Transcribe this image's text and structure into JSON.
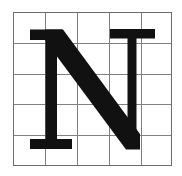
{
  "figure": {
    "kind": "letterform-grid-specimen",
    "title": "N",
    "background_color": "#ffffff"
  },
  "grid": {
    "name": "proportion-grid",
    "columns": 5,
    "rows": 5,
    "x_start": 13,
    "y_start": 12,
    "x_end": 171,
    "y_end": 165,
    "cell_width": 31.6,
    "cell_height": 30.6,
    "vertical_line_positions": [
      13,
      45,
      77,
      109,
      141,
      171
    ],
    "horizontal_line_positions": [
      12,
      43,
      74,
      104,
      135,
      165
    ],
    "line_color": "#808080",
    "border_color": "#6b6b6b",
    "line_width": 1,
    "border_width": 1.4
  },
  "glyph": {
    "name": "letter-n",
    "character": "N",
    "style": "serif-roman-capital",
    "fill_color": "#111111",
    "cap_height_top": 28,
    "baseline": 148,
    "left_stem_x": 48,
    "right_stem_x": 131,
    "left_stem_width": 9,
    "right_stem_width": 8,
    "diagonal_thickness": 19,
    "top_left_serif": {
      "x_left": 30,
      "x_right": 62,
      "y_top": 28,
      "y_bottom": 38
    },
    "top_right_serif": {
      "x_left": 110,
      "x_right": 155,
      "y_top": 28,
      "y_bottom": 37
    },
    "bottom_left_serif": {
      "x_left": 30,
      "x_right": 72,
      "y_top": 140,
      "y_bottom": 149
    },
    "diagonal_start": {
      "x": 48,
      "y": 30
    },
    "diagonal_end": {
      "x": 140,
      "y": 149
    },
    "paths": {
      "left_stem": "M 40.5 29.5 L 62.5 29.5 L 62.5 40.0 L 57.0 40.0 L 57.0 139.0 L 72.0 139.0 L 72.0 149.0 L 30.0 149.0 L 30.0 139.0 L 45.5 139.0 L 45.5 40.0 L 30.0 40.0 L 30.0 29.5 Z",
      "diagonal": "M 45.5 29.5 L 63.0 29.5 L 140.0 134.0 L 140.0 149.5 L 126.0 149.5 L 45.5 41.0 Z",
      "right_stem_with_serif": "M 110.0 29.0 L 155.0 29.0 L 155.0 38.5 L 136.5 38.5 L 136.5 149.0 L 127.5 149.0 L 127.5 38.5 L 110.0 38.5 Z"
    }
  }
}
